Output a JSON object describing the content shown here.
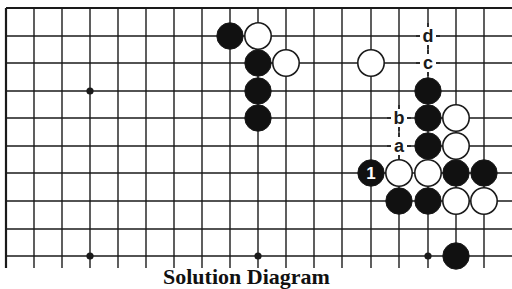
{
  "diagram": {
    "type": "go-board-partial",
    "caption": "Solution Diagram",
    "colors": {
      "background": "#ffffff",
      "line": "#1a1a1a",
      "black_stone": "#111111",
      "white_stone": "#ffffff"
    },
    "grid": {
      "x_lines": [
        6,
        34,
        62,
        90,
        118,
        146,
        174,
        202,
        230,
        258,
        286,
        314,
        342,
        371,
        399,
        428,
        456,
        484
      ],
      "y_lines": [
        8,
        36,
        63,
        91,
        118,
        146,
        173,
        201,
        229,
        256
      ],
      "x_extend_to": 512,
      "y_extend_to": 268,
      "top_edge": true,
      "left_edge": true
    },
    "star_points": [
      {
        "col": 3,
        "row": 3
      },
      {
        "col": 3,
        "row": 9
      },
      {
        "col": 9,
        "row": 9
      },
      {
        "col": 15,
        "row": 9
      }
    ],
    "stones": [
      {
        "col": 8,
        "row": 1,
        "color": "black"
      },
      {
        "col": 9,
        "row": 1,
        "color": "white"
      },
      {
        "col": 9,
        "row": 2,
        "color": "black"
      },
      {
        "col": 10,
        "row": 2,
        "color": "white"
      },
      {
        "col": 9,
        "row": 3,
        "color": "black"
      },
      {
        "col": 9,
        "row": 4,
        "color": "black"
      },
      {
        "col": 13,
        "row": 2,
        "color": "white"
      },
      {
        "col": 15,
        "row": 3,
        "color": "black"
      },
      {
        "col": 15,
        "row": 4,
        "color": "black"
      },
      {
        "col": 16,
        "row": 4,
        "color": "white"
      },
      {
        "col": 15,
        "row": 5,
        "color": "black"
      },
      {
        "col": 16,
        "row": 5,
        "color": "white"
      },
      {
        "col": 13,
        "row": 6,
        "color": "black",
        "label": "1"
      },
      {
        "col": 14,
        "row": 6,
        "color": "white"
      },
      {
        "col": 15,
        "row": 6,
        "color": "white"
      },
      {
        "col": 16,
        "row": 6,
        "color": "black"
      },
      {
        "col": 17,
        "row": 6,
        "color": "black"
      },
      {
        "col": 14,
        "row": 7,
        "color": "black"
      },
      {
        "col": 15,
        "row": 7,
        "color": "black"
      },
      {
        "col": 16,
        "row": 7,
        "color": "white"
      },
      {
        "col": 17,
        "row": 7,
        "color": "white"
      },
      {
        "col": 16,
        "row": 9,
        "color": "black"
      }
    ],
    "point_labels": [
      {
        "col": 15,
        "row": 1,
        "text": "d"
      },
      {
        "col": 15,
        "row": 2,
        "text": "c"
      },
      {
        "col": 14,
        "row": 4,
        "text": "b"
      },
      {
        "col": 14,
        "row": 5,
        "text": "a"
      }
    ]
  }
}
